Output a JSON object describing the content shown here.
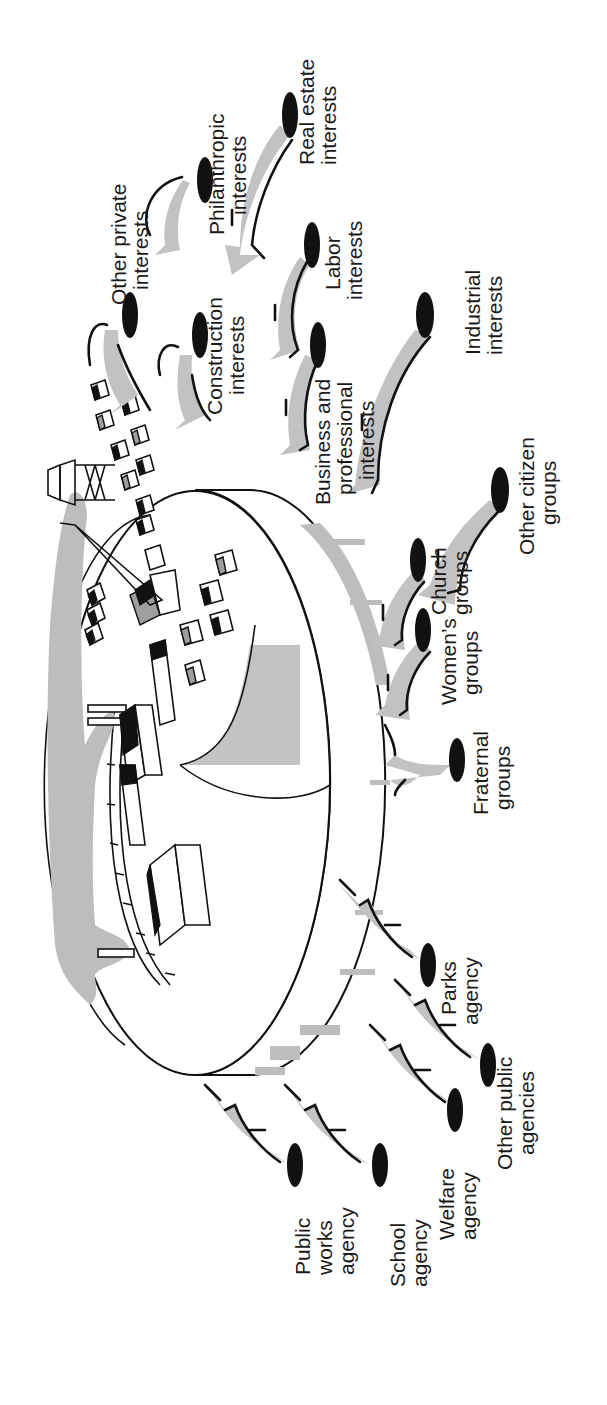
{
  "figure": {
    "orientation": "rotated 90° counter-clockwise (text reads bottom-to-top)",
    "center": {
      "name": "city",
      "description": "Isometric city on a raised disk with buildings, smokestacks with gray smoke, a railway, a radio tower and a crane"
    },
    "colors": {
      "arrow_fill": "#c2c2c2",
      "node_fill": "#111111",
      "smoke_fill": "#bdbdbd",
      "line": "#111111",
      "background": "#ffffff"
    },
    "groups": [
      {
        "id": "private",
        "nodes": [
          {
            "id": "real-estate",
            "line1": "Real estate",
            "line2": "interests"
          },
          {
            "id": "philanthropic",
            "line1": "Philanthropic",
            "line2": "interests"
          },
          {
            "id": "other-private",
            "line1": "Other private",
            "line2": "interests"
          },
          {
            "id": "construction",
            "line1": "Construction",
            "line2": "interests"
          },
          {
            "id": "labor",
            "line1": "Labor",
            "line2": "interests"
          },
          {
            "id": "industrial",
            "line1": "Industrial",
            "line2": "interests"
          },
          {
            "id": "business",
            "line1": "Business and",
            "line2": "professional",
            "line3": "interests"
          }
        ]
      },
      {
        "id": "citizen",
        "nodes": [
          {
            "id": "other-citizen",
            "line1": "Other citizen",
            "line2": "groups"
          },
          {
            "id": "church",
            "line1": "Church",
            "line2": "groups"
          },
          {
            "id": "womens",
            "line1": "Women’s",
            "line2": "groups"
          },
          {
            "id": "fraternal",
            "line1": "Fraternal",
            "line2": "groups"
          }
        ]
      },
      {
        "id": "public",
        "nodes": [
          {
            "id": "parks",
            "line1": "Parks",
            "line2": "agency"
          },
          {
            "id": "other-public",
            "line1": "Other public",
            "line2": "agencies"
          },
          {
            "id": "welfare",
            "line1": "Welfare",
            "line2": "agency"
          },
          {
            "id": "school",
            "line1": "School",
            "line2": "agency"
          },
          {
            "id": "public-works",
            "line1": "Public",
            "line2": "works",
            "line3": "agency"
          }
        ]
      }
    ]
  },
  "labels": {
    "real_estate": [
      "Real estate",
      "interests"
    ],
    "philanthropic": [
      "Philanthropic",
      "interests"
    ],
    "other_private": [
      "Other private",
      "interests"
    ],
    "construction": [
      "Construction",
      "interests"
    ],
    "labor": [
      "Labor",
      "interests"
    ],
    "industrial": [
      "Industrial",
      "interests"
    ],
    "business": [
      "Business and",
      "professional",
      "interests"
    ],
    "other_citizen": [
      "Other citizen",
      "groups"
    ],
    "church": [
      "Church",
      "groups"
    ],
    "womens": [
      "Women’s",
      "groups"
    ],
    "fraternal": [
      "Fraternal",
      "groups"
    ],
    "parks": [
      "Parks",
      "agency"
    ],
    "other_public": [
      "Other public",
      "agencies"
    ],
    "welfare": [
      "Welfare",
      "agency"
    ],
    "school": [
      "School",
      "agency"
    ],
    "public_works": [
      "Public",
      "works",
      "agency"
    ]
  }
}
